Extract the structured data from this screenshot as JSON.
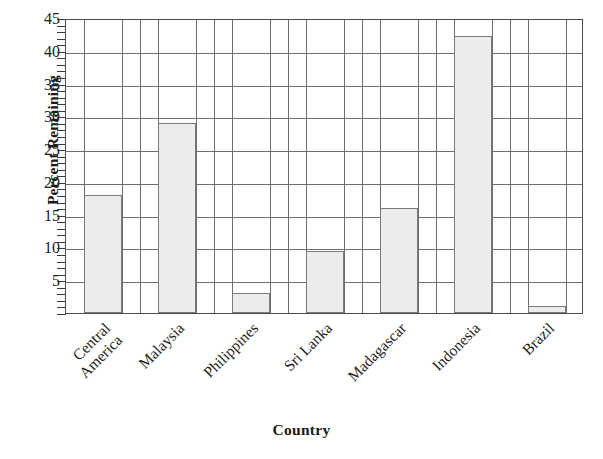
{
  "chart_data": {
    "type": "bar",
    "title": "",
    "xlabel": "Country",
    "ylabel": "Percent Remaining",
    "categories": [
      "Central America",
      "Malaysia",
      "Philippines",
      "Sri Lanka",
      "Madagascar",
      "Indonesia",
      "Brazil"
    ],
    "category_lines": [
      [
        "Central",
        "America"
      ],
      [
        "Malaysia"
      ],
      [
        "Philippines"
      ],
      [
        "Sri Lanka"
      ],
      [
        "Madagascar"
      ],
      [
        "Indonesia"
      ],
      [
        "Brazil"
      ]
    ],
    "values": [
      18,
      29,
      3,
      9.5,
      16,
      42.3,
      1
    ],
    "ylim": [
      0,
      45
    ],
    "yticks": [
      5,
      10,
      15,
      20,
      25,
      30,
      35,
      40,
      45
    ],
    "ytick_labels": [
      "5",
      "10",
      "15",
      "20",
      "25",
      "30",
      "35",
      "40",
      "45"
    ],
    "y_minor_tick_step": 1,
    "grid": "horizontal-and-vertical",
    "legend": "none",
    "bar_fill_color": "#ececec",
    "bar_edge_color": "#7a7a7a",
    "grid_color": "#6e6e6e",
    "frame_color": "#4d4d4d",
    "text_color": "#1a1a1a",
    "background_color": "#ffffff"
  }
}
